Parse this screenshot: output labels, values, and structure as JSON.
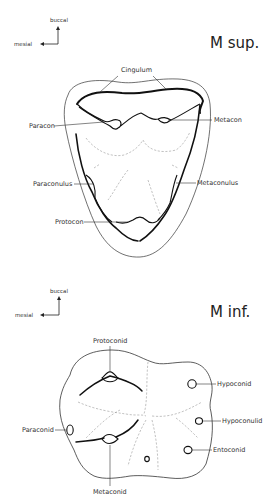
{
  "upper": {
    "title": "M sup.",
    "orientation": {
      "vertical": "buccal",
      "horizontal": "mesial"
    },
    "labels": {
      "cingulum": "Cingulum",
      "paracon": "Paracon",
      "metacon": "Metacon",
      "paraconulus": "Paraconulus",
      "metaconulus": "Metaconulus",
      "protocon": "Protocon"
    }
  },
  "lower": {
    "title": "M inf.",
    "orientation": {
      "vertical": "buccal",
      "horizontal": "mesial"
    },
    "labels": {
      "protoconid": "Protoconid",
      "hypoconid": "Hypoconid",
      "hypoconulid": "Hypoconulid",
      "paraconid": "Paraconid",
      "entoconid": "Entoconid",
      "metaconid": "Metaconid"
    }
  }
}
